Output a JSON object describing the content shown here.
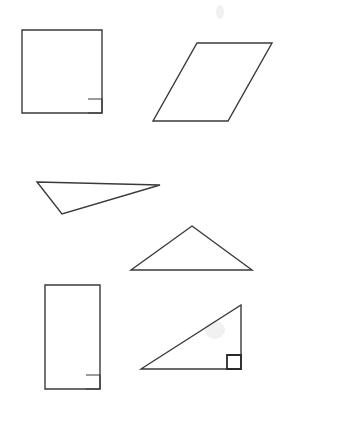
{
  "diagram": {
    "background": "#ffffff",
    "stroke_color": "#3a3a3a",
    "shapes": [
      {
        "id": "square",
        "kind": "square",
        "points": "22,30 102,30 102,113 22,113",
        "right_angle_marker": "88,99 102,99 102,113 88,113"
      },
      {
        "id": "rhombus",
        "kind": "rhombus",
        "points": "197,43 272,43 228,121 153,121"
      },
      {
        "id": "obtuse-triangle",
        "kind": "obtuse triangle",
        "points": "37,182 160,185 62,214"
      },
      {
        "id": "acute-triangle",
        "kind": "triangle",
        "points": "192,226 252,270 131,270"
      },
      {
        "id": "rectangle",
        "kind": "rectangle",
        "points": "45,285 100,285 100,389 45,389",
        "right_angle_marker": "86,375 100,375 100,389 86,389"
      },
      {
        "id": "right-triangle",
        "kind": "right triangle",
        "points": "141,369 241,305 241,369",
        "right_angle_marker": "227,355 241,355 241,369 227,369"
      }
    ]
  }
}
